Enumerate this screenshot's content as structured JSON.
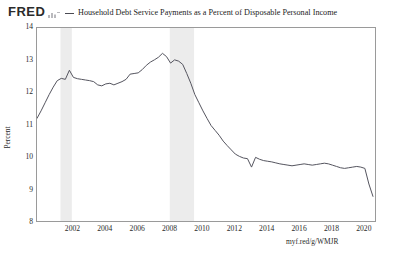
{
  "header": {
    "logo_text": "FRED",
    "logo_glyph": "mini-bar-chart-icon",
    "legend_swatch_color": "#4a4a52",
    "series_title": "Household Debt Service Payments as a Percent of Disposable Personal Income"
  },
  "source": {
    "url_text": "myf.red/g/WMJR"
  },
  "chart_data": {
    "type": "line",
    "title": "Household Debt Service Payments as a Percent of Disposable Personal Income",
    "xlabel": "",
    "ylabel": "Percent",
    "xlim": [
      1999.75,
      2020.75
    ],
    "ylim": [
      8,
      14
    ],
    "yticks": [
      8,
      9,
      10,
      11,
      12,
      13,
      14
    ],
    "xticks": [
      2002,
      2004,
      2006,
      2008,
      2010,
      2012,
      2014,
      2016,
      2018,
      2020
    ],
    "grid": false,
    "legend_position": "top",
    "line_color": "#55555f",
    "line_width": 1.0,
    "recession_band_color": "#ececec",
    "recession_bands": [
      {
        "start": 2001.2,
        "end": 2001.9,
        "label": "2001 recession"
      },
      {
        "start": 2007.95,
        "end": 2009.45,
        "label": "2008-2009 recession"
      }
    ],
    "series": [
      {
        "name": "Household Debt Service Payments as a Percent of Disposable Personal Income",
        "x": [
          1999.75,
          2000.0,
          2000.25,
          2000.5,
          2000.75,
          2001.0,
          2001.25,
          2001.5,
          2001.75,
          2002.0,
          2002.25,
          2002.5,
          2002.75,
          2003.0,
          2003.25,
          2003.5,
          2003.75,
          2004.0,
          2004.25,
          2004.5,
          2004.75,
          2005.0,
          2005.25,
          2005.5,
          2005.75,
          2006.0,
          2006.25,
          2006.5,
          2006.75,
          2007.0,
          2007.25,
          2007.5,
          2007.75,
          2008.0,
          2008.25,
          2008.5,
          2008.75,
          2009.0,
          2009.25,
          2009.5,
          2009.75,
          2010.0,
          2010.25,
          2010.5,
          2010.75,
          2011.0,
          2011.25,
          2011.5,
          2011.75,
          2012.0,
          2012.25,
          2012.5,
          2012.75,
          2013.0,
          2013.25,
          2013.5,
          2013.75,
          2014.0,
          2014.25,
          2014.5,
          2014.75,
          2015.0,
          2015.25,
          2015.5,
          2015.75,
          2016.0,
          2016.25,
          2016.5,
          2016.75,
          2017.0,
          2017.25,
          2017.5,
          2017.75,
          2018.0,
          2018.25,
          2018.5,
          2018.75,
          2019.0,
          2019.25,
          2019.5,
          2019.75,
          2020.0,
          2020.25,
          2020.5
        ],
        "values": [
          11.22,
          11.45,
          11.7,
          11.95,
          12.18,
          12.38,
          12.45,
          12.42,
          12.7,
          12.48,
          12.44,
          12.42,
          12.4,
          12.38,
          12.35,
          12.25,
          12.22,
          12.28,
          12.3,
          12.25,
          12.3,
          12.35,
          12.42,
          12.58,
          12.6,
          12.62,
          12.72,
          12.85,
          12.95,
          13.02,
          13.1,
          13.22,
          13.12,
          12.92,
          13.02,
          12.98,
          12.88,
          12.6,
          12.3,
          11.95,
          11.7,
          11.45,
          11.22,
          11.0,
          10.85,
          10.7,
          10.52,
          10.38,
          10.25,
          10.12,
          10.05,
          10.0,
          9.98,
          9.72,
          10.02,
          9.96,
          9.92,
          9.9,
          9.88,
          9.85,
          9.82,
          9.8,
          9.78,
          9.76,
          9.78,
          9.8,
          9.82,
          9.8,
          9.78,
          9.8,
          9.82,
          9.84,
          9.82,
          9.78,
          9.74,
          9.7,
          9.68,
          9.7,
          9.72,
          9.74,
          9.72,
          9.68,
          9.2,
          8.82
        ]
      }
    ]
  }
}
